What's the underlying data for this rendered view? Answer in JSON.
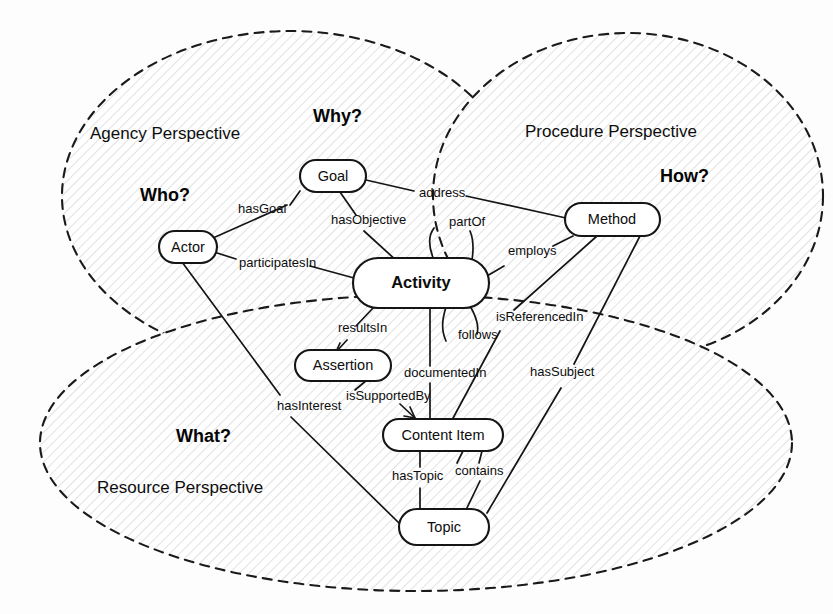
{
  "diagram": {
    "background_color": "#fdfdfd",
    "line_color": "#151515",
    "perspectives": [
      {
        "id": "agency",
        "name": "Agency Perspective",
        "question": "Who?",
        "cx": 290,
        "cy": 196,
        "rx": 228,
        "ry": 165,
        "name_x": 90,
        "name_y": 135,
        "question_x": 140,
        "question_y": 196
      },
      {
        "id": "procedure",
        "name": "Procedure Perspective",
        "question": "How?",
        "cx": 628,
        "cy": 196,
        "rx": 195,
        "ry": 163,
        "name_x": 525,
        "name_y": 133,
        "question_x": 660,
        "question_y": 177
      },
      {
        "id": "resource",
        "name": "Resource Perspective",
        "question": "What?",
        "cx": 416,
        "cy": 443,
        "rx": 376,
        "ry": 148,
        "name_x": 97,
        "name_y": 489,
        "question_x": 176,
        "question_y": 437
      }
    ],
    "center_question": {
      "label": "Why?",
      "x": 313,
      "y": 117
    },
    "entities": [
      {
        "id": "goal",
        "label": "Goal",
        "x": 300,
        "y": 160,
        "w": 66,
        "h": 32,
        "bold": false
      },
      {
        "id": "actor",
        "label": "Actor",
        "x": 159,
        "y": 231,
        "w": 58,
        "h": 32,
        "bold": false
      },
      {
        "id": "method",
        "label": "Method",
        "x": 565,
        "y": 203,
        "w": 95,
        "h": 33,
        "bold": false
      },
      {
        "id": "activity",
        "label": "Activity",
        "x": 353,
        "y": 258,
        "w": 136,
        "h": 50,
        "bold": true
      },
      {
        "id": "assertion",
        "label": "Assertion",
        "x": 295,
        "y": 350,
        "w": 96,
        "h": 31,
        "bold": false
      },
      {
        "id": "content-item",
        "label": "Content Item",
        "x": 383,
        "y": 419,
        "w": 120,
        "h": 32,
        "bold": false
      },
      {
        "id": "topic",
        "label": "Topic",
        "x": 399,
        "y": 509,
        "w": 90,
        "h": 36,
        "bold": false
      }
    ],
    "relations": [
      {
        "id": "hasGoal",
        "label": "hasGoal",
        "from": "actor",
        "to": "goal",
        "label_x": 238,
        "label_y": 210
      },
      {
        "id": "hasObjective",
        "label": "hasObjective",
        "from": "goal",
        "to": "activity",
        "label_x": 331,
        "label_y": 221
      },
      {
        "id": "address",
        "label": "address",
        "from": "goal",
        "to": "method",
        "label_x": 419,
        "label_y": 194
      },
      {
        "id": "participatesIn",
        "label": "participatesIn",
        "from": "actor",
        "to": "activity",
        "label_x": 239,
        "label_y": 264
      },
      {
        "id": "partOf",
        "label": "partOf",
        "from": "activity",
        "to": "activity",
        "label_x": 449,
        "label_y": 223
      },
      {
        "id": "employs",
        "label": "employs",
        "from": "activity",
        "to": "method",
        "label_x": 508,
        "label_y": 252
      },
      {
        "id": "follows",
        "label": "follows",
        "from": "activity",
        "to": "activity",
        "label_x": 458,
        "label_y": 336
      },
      {
        "id": "resultsIn",
        "label": "resultsIn",
        "from": "activity",
        "to": "assertion",
        "label_x": 338,
        "label_y": 329
      },
      {
        "id": "isReferencedIn",
        "label": "isReferencedIn",
        "from": "method",
        "to": "content-item",
        "label_x": 496,
        "label_y": 318
      },
      {
        "id": "hasSubject",
        "label": "hasSubject",
        "from": "method",
        "to": "topic",
        "label_x": 530,
        "label_y": 373
      },
      {
        "id": "documentedIn",
        "label": "documentedIn",
        "from": "activity",
        "to": "content-item",
        "label_x": 404,
        "label_y": 374
      },
      {
        "id": "isSupportedBy",
        "label": "isSupportedBy",
        "from": "content-item",
        "to": "assertion",
        "label_x": 346,
        "label_y": 397
      },
      {
        "id": "hasInterest",
        "label": "hasInterest",
        "from": "actor",
        "to": "topic",
        "label_x": 277,
        "label_y": 407
      },
      {
        "id": "hasTopic",
        "label": "hasTopic",
        "from": "content-item",
        "to": "topic",
        "label_x": 392,
        "label_y": 477
      },
      {
        "id": "contains",
        "label": "contains",
        "from": "topic",
        "to": "content-item",
        "label_x": 455,
        "label_y": 472
      }
    ]
  }
}
